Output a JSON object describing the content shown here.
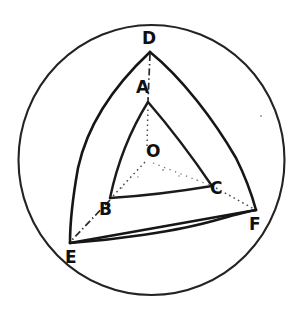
{
  "figure": {
    "ink_color": "#1a1a1a",
    "background_color": "#ffffff",
    "canvas": {
      "width": 303,
      "height": 323
    },
    "circle": {
      "cx": 151.5,
      "cy": 160,
      "r": 134,
      "label": "great-circle-outline"
    },
    "vertices": [
      {
        "id": "D",
        "label": "D",
        "x": 150,
        "y": 52,
        "label_x": 142,
        "label_y": 30,
        "group": "outer"
      },
      {
        "id": "E",
        "label": "E",
        "x": 70,
        "y": 243,
        "label_x": 65,
        "label_y": 249,
        "group": "outer"
      },
      {
        "id": "F",
        "label": "F",
        "x": 256,
        "y": 210,
        "label_x": 249,
        "label_y": 216,
        "group": "outer"
      },
      {
        "id": "A",
        "label": "A",
        "x": 148,
        "y": 102,
        "label_x": 136,
        "label_y": 79,
        "group": "inner"
      },
      {
        "id": "B",
        "label": "B",
        "x": 110,
        "y": 198,
        "label_x": 99,
        "label_y": 201,
        "group": "inner"
      },
      {
        "id": "C",
        "label": "C",
        "x": 212,
        "y": 186,
        "label_x": 210,
        "label_y": 180,
        "group": "inner"
      },
      {
        "id": "O",
        "label": "O",
        "x": 148,
        "y": 155,
        "label_x": 146,
        "label_y": 143,
        "group": "center"
      }
    ],
    "outer_triangle": {
      "name": "outer-spherical-triangle",
      "vertex_ids": [
        "D",
        "E",
        "F"
      ],
      "edges": [
        {
          "from": "D",
          "to": "E",
          "style": "arc-bulge-outward"
        },
        {
          "from": "E",
          "to": "F",
          "style": "straight"
        },
        {
          "from": "F",
          "to": "D",
          "style": "arc-bulge-outward"
        }
      ]
    },
    "inner_triangle": {
      "name": "inner-spherical-triangle",
      "vertex_ids": [
        "A",
        "B",
        "C"
      ],
      "edges": [
        {
          "from": "A",
          "to": "B",
          "style": "arc-bulge-outward"
        },
        {
          "from": "B",
          "to": "C",
          "style": "arc-bulge-outward"
        },
        {
          "from": "C",
          "to": "A",
          "style": "arc-bulge-outward"
        }
      ]
    },
    "secondary_arc": {
      "name": "lower-chord-arc-E-F",
      "from": "E",
      "to": "F",
      "style": "arc-bulge-downward"
    },
    "radial_lines": [
      {
        "name": "radius-O-A",
        "from": "O",
        "to": "A",
        "style": "dotted"
      },
      {
        "name": "radius-O-B",
        "from": "O",
        "to": "B",
        "style": "dotted"
      },
      {
        "name": "radius-O-C",
        "from": "O",
        "to": "C",
        "style": "dotted-faint"
      }
    ],
    "projection_lines": [
      {
        "name": "projection-D-A",
        "from": "D",
        "to": "A",
        "style": "dash-dot"
      },
      {
        "name": "projection-B-E",
        "from": "B",
        "to": "E",
        "style": "dash-dot"
      },
      {
        "name": "projection-C-F",
        "from": "C",
        "to": "F",
        "style": "dotted"
      }
    ]
  }
}
